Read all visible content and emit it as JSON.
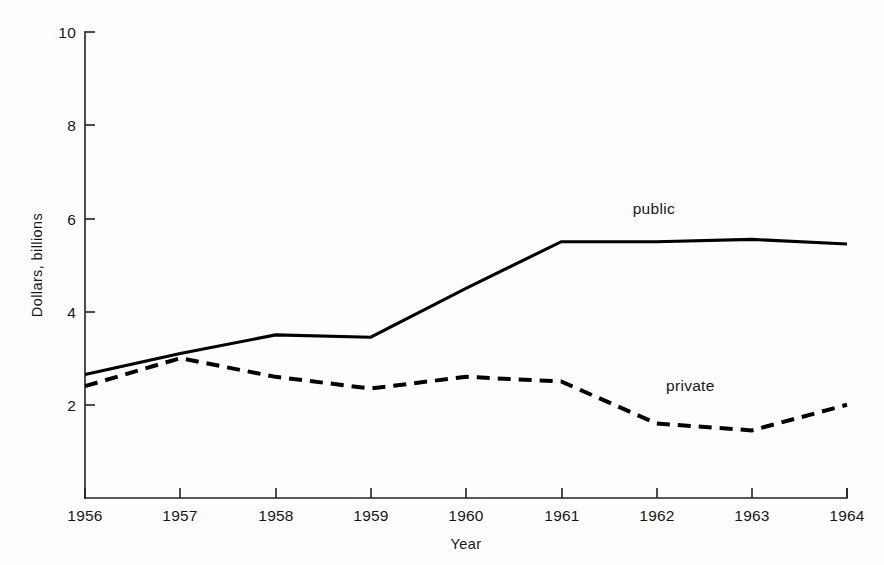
{
  "chart_data": {
    "type": "line",
    "title": "",
    "subtitle": "",
    "xlabel": "Year",
    "ylabel": "Dollars, billions",
    "x": [
      1956,
      1957,
      1958,
      1959,
      1960,
      1961,
      1962,
      1963,
      1964
    ],
    "categories": [
      "1956",
      "1957",
      "1958",
      "1959",
      "1960",
      "1961",
      "1962",
      "1963",
      "1964"
    ],
    "xlim": [
      1956,
      1964
    ],
    "ylim": [
      0,
      10
    ],
    "xticks": [
      "1956",
      "1957",
      "1958",
      "1959",
      "1960",
      "1961",
      "1962",
      "1963",
      "1964"
    ],
    "yticks": [
      "2",
      "4",
      "6",
      "8",
      "10"
    ],
    "ytick_values": [
      2,
      4,
      6,
      8,
      10
    ],
    "grid": false,
    "legend": "inline-annotations",
    "series": [
      {
        "name": "public",
        "style": "solid",
        "color": "#000000",
        "values": [
          2.65,
          3.1,
          3.5,
          3.45,
          4.5,
          5.5,
          5.5,
          5.55,
          5.45
        ],
        "label_text": "public",
        "label_x": 1961.75,
        "label_y": 6.1
      },
      {
        "name": "private",
        "style": "dashed",
        "color": "#000000",
        "values": [
          2.4,
          3.0,
          2.6,
          2.35,
          2.6,
          2.5,
          1.6,
          1.45,
          2.0
        ],
        "label_text": "private",
        "label_x": 1962.1,
        "label_y": 2.3
      }
    ],
    "annotations": [
      {
        "text": "public",
        "x": 1961.75,
        "y": 6.1
      },
      {
        "text": "private",
        "x": 1962.1,
        "y": 2.3
      }
    ]
  },
  "axes": {
    "y_title": "Dollars, billions",
    "x_title": "Year"
  },
  "caption": {
    "text": ""
  }
}
